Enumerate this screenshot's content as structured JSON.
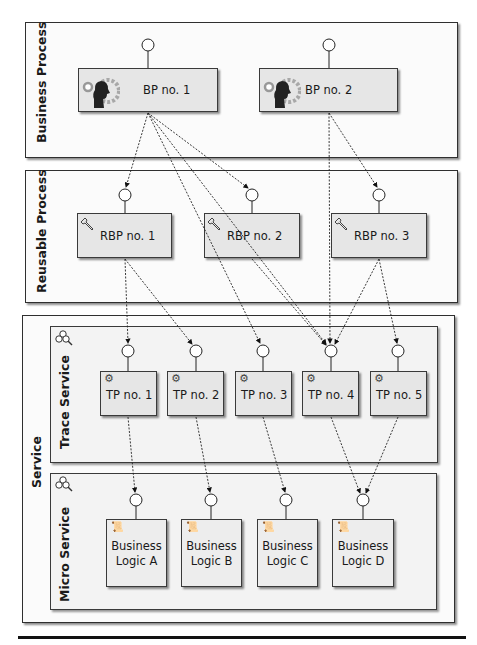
{
  "pools": {
    "business_process": {
      "label": "Business Process"
    },
    "reusable_process": {
      "label": "Reusable Process"
    },
    "service": {
      "label": "Service",
      "lanes": {
        "trace_service": {
          "label": "Trace Service"
        },
        "micro_service": {
          "label": "Micro Service"
        }
      }
    }
  },
  "business_processes": [
    {
      "label": "BP no. 1",
      "icon": "person-gear-icon"
    },
    {
      "label": "BP no. 2",
      "icon": "person-gear-icon"
    }
  ],
  "reusable_processes": [
    {
      "label": "RBP no. 1",
      "icon": "wrench-icon"
    },
    {
      "label": "RBP no. 2",
      "icon": "wrench-icon"
    },
    {
      "label": "RBP no. 3",
      "icon": "wrench-icon"
    }
  ],
  "trace_processes": [
    {
      "label": "TP no. 1",
      "icon": "gear-icon"
    },
    {
      "label": "TP no. 2",
      "icon": "gear-icon"
    },
    {
      "label": "TP no. 3",
      "icon": "gear-icon"
    },
    {
      "label": "TP no. 4",
      "icon": "gear-icon"
    },
    {
      "label": "TP no. 5",
      "icon": "gear-icon"
    }
  ],
  "business_logic": [
    {
      "line1": "Business",
      "line2": "Logic A",
      "icon": "script-icon"
    },
    {
      "line1": "Business",
      "line2": "Logic B",
      "icon": "script-icon"
    },
    {
      "line1": "Business",
      "line2": "Logic C",
      "icon": "script-icon"
    },
    {
      "line1": "Business",
      "line2": "Logic D",
      "icon": "script-icon"
    }
  ],
  "connections": [
    {
      "from": "BP no. 1",
      "to": "RBP no. 1"
    },
    {
      "from": "BP no. 1",
      "to": "RBP no. 2"
    },
    {
      "from": "BP no. 1",
      "to": "TP no. 3"
    },
    {
      "from": "BP no. 1",
      "to": "TP no. 4"
    },
    {
      "from": "BP no. 2",
      "to": "TP no. 4"
    },
    {
      "from": "BP no. 2",
      "to": "RBP no. 3"
    },
    {
      "from": "RBP no. 1",
      "to": "TP no. 1"
    },
    {
      "from": "RBP no. 1",
      "to": "TP no. 2"
    },
    {
      "from": "RBP no. 2",
      "to": "TP no. 4"
    },
    {
      "from": "RBP no. 3",
      "to": "TP no. 4"
    },
    {
      "from": "RBP no. 3",
      "to": "TP no. 5"
    },
    {
      "from": "TP no. 1",
      "to": "Business Logic A"
    },
    {
      "from": "TP no. 2",
      "to": "Business Logic B"
    },
    {
      "from": "TP no. 3",
      "to": "Business Logic C"
    },
    {
      "from": "TP no. 4",
      "to": "Business Logic D"
    },
    {
      "from": "TP no. 5",
      "to": "Business Logic D"
    }
  ]
}
